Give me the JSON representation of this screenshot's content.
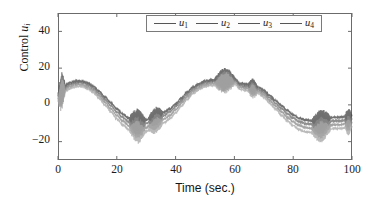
{
  "chart_data": {
    "type": "line",
    "title": "",
    "xlabel": "Time (sec.)",
    "ylabel": "Control u_i",
    "ylabel_base": "Control",
    "ylabel_symbol": "u",
    "ylabel_subscript": "i",
    "xlim": [
      0,
      100
    ],
    "ylim": [
      -30,
      50
    ],
    "xticks": [
      0,
      20,
      40,
      60,
      80,
      100
    ],
    "yticks": [
      -20,
      0,
      20,
      40
    ],
    "xticklabels": [
      "0",
      "20",
      "40",
      "60",
      "80",
      "100"
    ],
    "yticklabels": [
      "-20",
      "0",
      "20",
      "40"
    ],
    "grid": false,
    "box": true,
    "tick_direction": "in",
    "legend": {
      "position": "top-center-right",
      "boxed": true,
      "entries": [
        {
          "label": "u",
          "subscript": "1",
          "color": "#4a4a4a"
        },
        {
          "label": "u",
          "subscript": "2",
          "color": "#6e6e6e"
        },
        {
          "label": "u",
          "subscript": "3",
          "color": "#8a8a8a"
        },
        {
          "label": "u",
          "subscript": "4",
          "color": "#a6a6a6"
        }
      ]
    },
    "series": [
      {
        "name": "u1",
        "color": "#4a4a4a",
        "amplitude": 11.0,
        "period": 33.0,
        "phase_deg": 0,
        "offset": 0.8,
        "band_offset": 1.6
      },
      {
        "name": "u2",
        "color": "#6e6e6e",
        "amplitude": 11.6,
        "period": 33.0,
        "phase_deg": 0,
        "offset": 0.4,
        "band_offset": 0.6
      },
      {
        "name": "u3",
        "color": "#8a8a8a",
        "amplitude": 12.2,
        "period": 33.0,
        "phase_deg": 0,
        "offset": 0.0,
        "band_offset": -0.6
      },
      {
        "name": "u4",
        "color": "#a6a6a6",
        "amplitude": 12.8,
        "period": 33.0,
        "phase_deg": 0,
        "offset": -0.4,
        "band_offset": -1.8
      }
    ],
    "chatter_bursts": [
      {
        "t_start": 0.0,
        "t_end": 2.5,
        "amp": 9.0
      },
      {
        "t_start": 24.0,
        "t_end": 30.0,
        "amp": 6.5
      },
      {
        "t_start": 30.5,
        "t_end": 36.0,
        "amp": 4.5
      },
      {
        "t_start": 53.0,
        "t_end": 60.5,
        "amp": 6.0
      },
      {
        "t_start": 64.5,
        "t_end": 68.0,
        "amp": 4.0
      },
      {
        "t_start": 86.0,
        "t_end": 93.0,
        "amp": 6.0
      },
      {
        "t_start": 97.5,
        "t_end": 100.0,
        "amp": 4.5
      }
    ],
    "step_events": [
      {
        "t": 30.0,
        "note": "level jump at trough"
      },
      {
        "t": 60.0,
        "note": "level jump at crest"
      },
      {
        "t": 65.5,
        "note": "level jump after crest"
      },
      {
        "t": 97.8,
        "note": "level jump at trough"
      }
    ],
    "x_samples": [
      0,
      2,
      4,
      6,
      8,
      10,
      12,
      14,
      16,
      18,
      20,
      22,
      24,
      26,
      28,
      30,
      32,
      34,
      36,
      38,
      40,
      42,
      44,
      46,
      48,
      50,
      52,
      54,
      56,
      58,
      60,
      62,
      64,
      66,
      68,
      70,
      72,
      74,
      76,
      78,
      80,
      82,
      84,
      86,
      88,
      90,
      92,
      94,
      96,
      98,
      100
    ],
    "y_center": [
      4.0,
      8.5,
      10.5,
      11.5,
      11.5,
      10.5,
      8.5,
      5.5,
      2.0,
      -1.5,
      -5.0,
      -8.0,
      -10.5,
      -11.5,
      -12.0,
      -11.5,
      -9.5,
      -8.0,
      -7.0,
      -5.0,
      -2.0,
      1.5,
      5.0,
      8.0,
      10.0,
      11.5,
      12.0,
      12.5,
      13.0,
      13.5,
      13.0,
      10.0,
      9.5,
      9.0,
      8.0,
      6.0,
      3.0,
      0.0,
      -3.0,
      -6.0,
      -8.5,
      -10.5,
      -11.5,
      -12.0,
      -12.0,
      -11.5,
      -10.5,
      -10.0,
      -10.0,
      -9.5,
      -9.0
    ]
  },
  "axes": {
    "x_title": "Time (sec.)",
    "y_title_text": "Control",
    "y_title_symbol": "u",
    "y_title_sub": "i"
  },
  "ticks": {
    "x": [
      {
        "label": "0",
        "value": 0
      },
      {
        "label": "20",
        "value": 20
      },
      {
        "label": "40",
        "value": 40
      },
      {
        "label": "60",
        "value": 60
      },
      {
        "label": "80",
        "value": 80
      },
      {
        "label": "100",
        "value": 100
      }
    ],
    "y": [
      {
        "label": "40",
        "value": 40
      },
      {
        "label": "20",
        "value": 20
      },
      {
        "label": "0",
        "value": 0
      },
      {
        "label": "−20",
        "value": -20
      }
    ]
  },
  "legend_items": [
    {
      "sym": "u",
      "sub": "1"
    },
    {
      "sym": "u",
      "sub": "2"
    },
    {
      "sym": "u",
      "sub": "3"
    },
    {
      "sym": "u",
      "sub": "4"
    }
  ],
  "colors": {
    "axis": "#6b6b6b",
    "text": "#1b1b1b",
    "band_dark": "#5a5a5a",
    "band_light": "#b2b2b2",
    "legend_border": "#7a7a7a"
  }
}
